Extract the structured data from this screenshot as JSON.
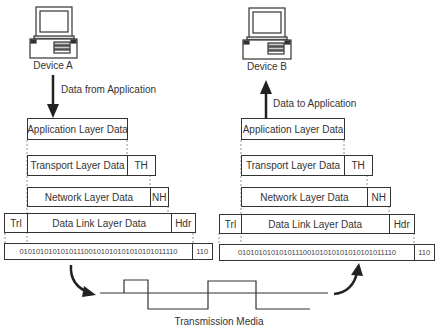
{
  "left_stack": {
    "device_label": "Device A",
    "flow_label": "Data from Application",
    "application": {
      "data": "Application Layer Data"
    },
    "transport": {
      "data": "Transport Layer Data",
      "header": "TH"
    },
    "network": {
      "data": "Network Layer Data",
      "header": "NH"
    },
    "datalink": {
      "trailer": "Trl",
      "data": "Data Link Layer Data",
      "header": "Hdr"
    },
    "physical": {
      "bits": "010101010101011100101010101010101011110",
      "header": "110"
    }
  },
  "right_stack": {
    "device_label": "Device B",
    "flow_label": "Data to Application",
    "application": {
      "data": "Application Layer Data"
    },
    "transport": {
      "data": "Transport Layer Data",
      "header": "TH"
    },
    "network": {
      "data": "Network Layer Data",
      "header": "NH"
    },
    "datalink": {
      "trailer": "Trl",
      "data": "Data Link Layer Data",
      "header": "Hdr"
    },
    "physical": {
      "bits": "010101010101011100101010101010101011110",
      "header": "110"
    }
  },
  "media": {
    "label": "Transmission Media"
  },
  "colors": {
    "line": "#333333",
    "background": "#ffffff"
  }
}
